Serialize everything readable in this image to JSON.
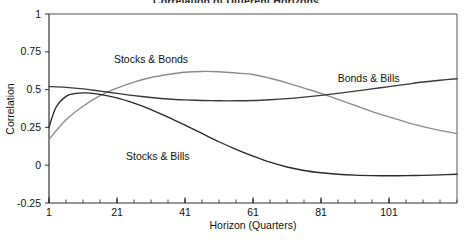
{
  "chart_data": {
    "type": "line",
    "title": "Correlation of Different Horizons",
    "xlabel": "Horizon (Quarters)",
    "ylabel": "Correlation",
    "xlim": [
      1,
      121
    ],
    "ylim": [
      -0.25,
      1
    ],
    "yticks": [
      1,
      0.75,
      0.5,
      0.25,
      0,
      -0.25
    ],
    "ytick_labels": [
      "1",
      "0.75",
      "0.5",
      "0.25",
      "0",
      "-0.25"
    ],
    "xticks": [
      1,
      21,
      41,
      61,
      81,
      101
    ],
    "xtick_labels": [
      "1",
      "21",
      "41",
      "61",
      "81",
      "101"
    ],
    "minor_xtick_step": 5,
    "grid": false,
    "legend_position": "inline-annotations",
    "series": [
      {
        "name": "Stocks & Bonds",
        "color": "#8c8c8c",
        "label_x": 31,
        "label_y": 0.7,
        "x": [
          1,
          6,
          11,
          16,
          21,
          26,
          31,
          36,
          41,
          46,
          51,
          56,
          61,
          66,
          71,
          76,
          81,
          86,
          91,
          96,
          101,
          106,
          111,
          116,
          121
        ],
        "values": [
          0.17,
          0.3,
          0.39,
          0.46,
          0.51,
          0.55,
          0.58,
          0.6,
          0.615,
          0.62,
          0.618,
          0.61,
          0.6,
          0.575,
          0.545,
          0.51,
          0.475,
          0.435,
          0.395,
          0.355,
          0.32,
          0.285,
          0.255,
          0.23,
          0.21
        ]
      },
      {
        "name": "Bonds & Bills",
        "color": "#3a3a3a",
        "label_x": 95,
        "label_y": 0.575,
        "x": [
          1,
          6,
          11,
          16,
          21,
          26,
          31,
          36,
          41,
          46,
          51,
          56,
          61,
          66,
          71,
          76,
          81,
          86,
          91,
          96,
          101,
          106,
          111,
          116,
          121
        ],
        "values": [
          0.52,
          0.515,
          0.505,
          0.49,
          0.475,
          0.46,
          0.448,
          0.438,
          0.432,
          0.428,
          0.426,
          0.426,
          0.428,
          0.433,
          0.44,
          0.45,
          0.462,
          0.475,
          0.49,
          0.505,
          0.52,
          0.535,
          0.55,
          0.562,
          0.572
        ]
      },
      {
        "name": "Stocks & Bills",
        "color": "#2a2a2a",
        "label_x": 33,
        "label_y": 0.055,
        "x": [
          1,
          3,
          6,
          9,
          12,
          16,
          21,
          26,
          31,
          36,
          41,
          46,
          51,
          56,
          61,
          66,
          71,
          76,
          81,
          86,
          91,
          96,
          101,
          106,
          111,
          116,
          121
        ],
        "values": [
          0.25,
          0.38,
          0.455,
          0.475,
          0.478,
          0.468,
          0.445,
          0.41,
          0.368,
          0.318,
          0.265,
          0.21,
          0.155,
          0.105,
          0.06,
          0.02,
          -0.012,
          -0.035,
          -0.05,
          -0.06,
          -0.066,
          -0.069,
          -0.07,
          -0.069,
          -0.067,
          -0.064,
          -0.06
        ]
      }
    ]
  }
}
